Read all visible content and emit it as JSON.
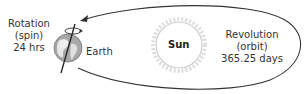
{
  "diagram": {
    "rotation": {
      "line1": "Rotation",
      "line2": "(spin)",
      "line3": "24 hrs"
    },
    "earth_label": "Earth",
    "sun_label": "Sun",
    "revolution": {
      "line1": "Revolution",
      "line2": "(orbit)",
      "line3": "365.25 days"
    },
    "colors": {
      "orbit": "#333333",
      "sun_outline": "#cccccc",
      "earth_fill": "#9a9a9a",
      "text": "#333333"
    }
  }
}
